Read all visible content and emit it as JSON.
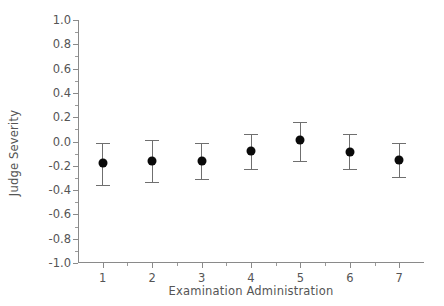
{
  "chart_data": {
    "type": "scatter",
    "title": "",
    "xlabel": "Examination Administration",
    "ylabel": "Judge Severity",
    "categories": [
      "1",
      "2",
      "3",
      "4",
      "5",
      "6",
      "7"
    ],
    "x": [
      1,
      2,
      3,
      4,
      5,
      6,
      7
    ],
    "values": [
      -0.18,
      -0.16,
      -0.16,
      -0.08,
      0.01,
      -0.09,
      -0.15
    ],
    "error_low": [
      -0.36,
      -0.33,
      -0.31,
      -0.23,
      -0.16,
      -0.23,
      -0.29
    ],
    "error_high": [
      -0.01,
      0.01,
      -0.01,
      0.06,
      0.16,
      0.06,
      -0.01
    ],
    "xlim": [
      0.5,
      7.5
    ],
    "ylim": [
      -1.0,
      1.0
    ],
    "yticks": [
      "1.0",
      "0.8",
      "0.6",
      "0.4",
      "0.2",
      "0.0",
      "-0.2",
      "-0.4",
      "-0.6",
      "-0.8",
      "-1.0"
    ],
    "ytick_values": [
      1.0,
      0.8,
      0.6,
      0.4,
      0.2,
      0.0,
      -0.2,
      -0.4,
      -0.6,
      -0.8,
      -1.0
    ],
    "ytick_minor_values": [
      0.9,
      0.7,
      0.5,
      0.3,
      0.1,
      -0.1,
      -0.3,
      -0.5,
      -0.7,
      -0.9
    ],
    "xtick_minor_values": [
      1.5,
      2.5,
      3.5,
      4.5,
      5.5,
      6.5
    ],
    "grid": false,
    "legend": "none",
    "marker_color": "#0a0a0a",
    "errorbar_color": "#6f6f6f",
    "axis_color": "#8a8a8a",
    "text_color": "#555555",
    "background": "#ffffff"
  }
}
